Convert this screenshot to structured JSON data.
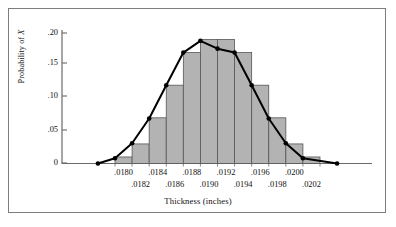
{
  "chart_data": {
    "type": "bar",
    "title": "",
    "xlabel": "Thickness (inches)",
    "ylabel": "Probability of X",
    "ylabel_prefix": "Probability of ",
    "ylabel_variable": "X",
    "ylim": [
      0,
      0.2
    ],
    "yticks": [
      0,
      0.05,
      0.1,
      0.15,
      0.2
    ],
    "ytick_labels": [
      "0",
      ".05",
      ".10",
      ".15",
      ".20"
    ],
    "grid": false,
    "legend": null,
    "xtick_labels_upper": [
      ".0180",
      ".0184",
      ".0188",
      ".0192",
      ".0196",
      ".0200"
    ],
    "xtick_labels_lower": [
      ".0182",
      ".0186",
      ".0190",
      ".0194",
      ".0198",
      ".0202"
    ],
    "categories": [
      ".0180",
      ".0182",
      ".0184",
      ".0186",
      ".0188",
      ".0190",
      ".0192",
      ".0194",
      ".0196",
      ".0198",
      ".0200",
      ".0202"
    ],
    "values": [
      0.01,
      0.03,
      0.07,
      0.12,
      0.17,
      0.19,
      0.19,
      0.17,
      0.12,
      0.07,
      0.03,
      0.01
    ],
    "bar_fill": "#b3b3b3",
    "bar_edge": "#555555",
    "line_color": "#000000",
    "marker_color": "#000000",
    "overlay_series": {
      "name": "normal-curve",
      "x": [
        ".0177",
        ".0179",
        ".0181",
        ".0183",
        ".0185",
        ".0187",
        ".0189",
        ".0191",
        ".0193",
        ".0195",
        ".0197",
        ".0199",
        ".0201",
        ".0205"
      ],
      "y": [
        0.0,
        0.008,
        0.031,
        0.069,
        0.12,
        0.17,
        0.188,
        0.176,
        0.17,
        0.12,
        0.069,
        0.031,
        0.008,
        0.0
      ]
    }
  },
  "figure": {
    "frame_color": "#7d7d7d",
    "background": "#ffffff",
    "axis_color": "#6a6a6a"
  }
}
